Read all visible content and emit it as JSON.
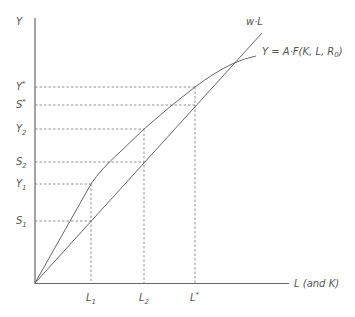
{
  "diagram": {
    "axes": {
      "y_label": "Y",
      "x_label": "L (and K)"
    },
    "curves": {
      "wage_line_label": "w·L",
      "production_label": "Y = A·F(K, L, R",
      "production_label_sub": "0",
      "production_label_end": ")"
    },
    "y_ticks": [
      {
        "base": "Y",
        "sup": "*",
        "sub": "",
        "y": 87
      },
      {
        "base": "S",
        "sup": "*",
        "sub": "",
        "y": 105
      },
      {
        "base": "Y",
        "sup": "",
        "sub": "2",
        "y": 129
      },
      {
        "base": "S",
        "sup": "",
        "sub": "2",
        "y": 162
      },
      {
        "base": "Y",
        "sup": "",
        "sub": "1",
        "y": 184
      },
      {
        "base": "S",
        "sup": "",
        "sub": "1",
        "y": 221
      }
    ],
    "x_ticks": [
      {
        "base": "L",
        "sup": "",
        "sub": "1",
        "x": 91
      },
      {
        "base": "L",
        "sup": "",
        "sub": "2",
        "x": 144
      },
      {
        "base": "L",
        "sup": "*",
        "sub": "",
        "x": 195
      }
    ],
    "colors": {
      "line": "#666666",
      "text": "#555555"
    }
  }
}
